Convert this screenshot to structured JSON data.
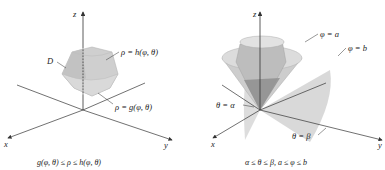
{
  "left_figure": {
    "axes": {
      "x": "x",
      "y": "y",
      "z": "z"
    },
    "region_label": "D",
    "upper_surface": "ρ = h(φ, θ)",
    "lower_surface": "ρ = g(φ, θ)",
    "caption": "g(φ, θ) ≤ ρ ≤ h(φ, θ)"
  },
  "right_figure": {
    "axes": {
      "x": "x",
      "y": "y",
      "z": "z"
    },
    "cone_a": "φ = a",
    "cone_b": "φ = b",
    "plane_alpha": "θ = α",
    "plane_beta": "θ = β",
    "caption": "α ≤ θ ≤ β, a ≤ φ ≤ b"
  },
  "colors": {
    "surface": "#c8c8c8",
    "surface_dark": "#9a9a9a",
    "axis": "#333333"
  }
}
